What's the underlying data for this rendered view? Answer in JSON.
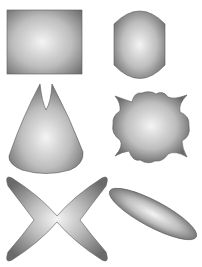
{
  "canvas": {
    "width": 202,
    "height": 267,
    "background": "#ffffff"
  },
  "gradient": {
    "center_color": "#f4f4f4",
    "mid_color": "#bdbdbd",
    "edge_color": "#6a6a6a",
    "stroke_color": "#5a5a5a"
  },
  "shapes": [
    {
      "id": "rectangle",
      "label": "Rectangle"
    },
    {
      "id": "barrel",
      "label": "Barrel"
    },
    {
      "id": "notched-cone",
      "label": "Notched cone"
    },
    {
      "id": "wavy-starburst",
      "label": "Wavy starburst"
    },
    {
      "id": "four-petal-x",
      "label": "Four-petal X"
    },
    {
      "id": "tilted-ellipse",
      "label": "Tilted ellipse"
    }
  ]
}
